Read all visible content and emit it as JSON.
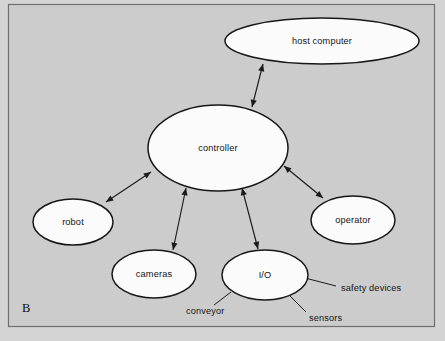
{
  "figure": {
    "panel_letter": "B",
    "background_color": "#cccccc",
    "frame_border_color": "#6f6f6f",
    "node_fill_color": "#fbfbfb",
    "node_stroke_color": "#171717",
    "connector_color": "#1b1b1b"
  },
  "nodes": [
    {
      "id": "host-computer",
      "label": "host computer",
      "cx": 322,
      "cy": 41,
      "rx": 97,
      "ry": 23
    },
    {
      "id": "controller",
      "label": "controller",
      "cx": 218,
      "cy": 148,
      "rx": 70,
      "ry": 43
    },
    {
      "id": "robot",
      "label": "robot",
      "cx": 73,
      "cy": 222,
      "rx": 40,
      "ry": 23
    },
    {
      "id": "cameras",
      "label": "cameras",
      "cx": 154,
      "cy": 274,
      "rx": 42,
      "ry": 24
    },
    {
      "id": "io",
      "label": "I/O",
      "cx": 265,
      "cy": 275,
      "rx": 43,
      "ry": 25
    },
    {
      "id": "operator",
      "label": "operator",
      "cx": 353,
      "cy": 220,
      "rx": 42,
      "ry": 24
    }
  ],
  "connections": [
    {
      "id": "controller-host-computer",
      "from": "controller",
      "to": "host-computer",
      "arrow_type": "double",
      "x1": 252,
      "y1": 107,
      "x2": 263,
      "y2": 64
    },
    {
      "id": "controller-robot",
      "from": "controller",
      "to": "robot",
      "arrow_type": "double",
      "x1": 151,
      "y1": 172,
      "x2": 106,
      "y2": 202
    },
    {
      "id": "controller-cameras",
      "from": "controller",
      "to": "cameras",
      "arrow_type": "double",
      "x1": 186,
      "y1": 188,
      "x2": 173,
      "y2": 250
    },
    {
      "id": "controller-io",
      "from": "controller",
      "to": "io",
      "arrow_type": "double",
      "x1": 242,
      "y1": 188,
      "x2": 258,
      "y2": 249
    },
    {
      "id": "controller-operator",
      "from": "controller",
      "to": "operator",
      "arrow_type": "double",
      "x1": 284,
      "y1": 166,
      "x2": 323,
      "y2": 198
    }
  ],
  "leader_labels": [
    {
      "id": "conveyor",
      "label": "conveyor",
      "text_x": 186,
      "text_y": 314,
      "line_x1": 231,
      "line_y1": 292,
      "line_x2": 214,
      "line_y2": 305
    },
    {
      "id": "sensors",
      "label": "sensors",
      "text_x": 309,
      "text_y": 321,
      "line_x1": 288,
      "line_y1": 294,
      "line_x2": 306,
      "line_y2": 312
    },
    {
      "id": "safety-devices",
      "label": "safety devices",
      "text_x": 341,
      "text_y": 291,
      "line_x1": 305,
      "line_y1": 278,
      "line_x2": 336,
      "line_y2": 286
    }
  ]
}
